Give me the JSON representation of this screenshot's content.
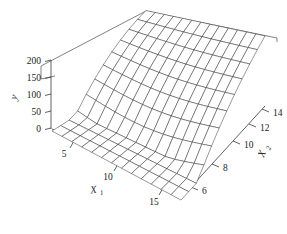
{
  "chart_data": {
    "type": "surface",
    "title": "",
    "xlabel": "X1",
    "ylabel": "X2",
    "zlabel": "y",
    "xlabel_base": "X",
    "xlabel_sub": "1",
    "ylabel_base": "X",
    "ylabel_sub": "2",
    "x_ticks": [
      5,
      10,
      15
    ],
    "x_tick_labels": [
      "5",
      "10",
      "15"
    ],
    "y_ticks": [
      6,
      8,
      10,
      12,
      14
    ],
    "y_tick_labels": [
      "6",
      "8",
      "10",
      "12",
      "14"
    ],
    "z_ticks": [
      0,
      50,
      100,
      150,
      200
    ],
    "z_tick_labels": [
      "0",
      "50",
      "100",
      "150",
      "200"
    ],
    "xlim": [
      2,
      17
    ],
    "ylim": [
      5,
      15
    ],
    "zlim": [
      0,
      200
    ],
    "grid": false,
    "legend": "none",
    "mesh_nx": 13,
    "mesh_ny": 11,
    "surface_color": "#ffffff",
    "mesh_color": "#1a1a1a",
    "frame_color": "#4a4a4a",
    "background": "#ffffff",
    "surface_equation_note": "z rises with X2 and with X1 interaction; back-left plateau near 170, back-middle dip, far-right corner maximum near 200",
    "z_values_corners": {
      "front_left": 0,
      "back_left": 170,
      "back_right": 200,
      "front_right": 30
    }
  },
  "axis_titles": {
    "x1": "X",
    "x1_sub": "1",
    "x2": "X",
    "x2_sub": "2",
    "z": "y"
  },
  "ticks": {
    "z": [
      "200",
      "150",
      "100",
      "50",
      "0"
    ],
    "x1": [
      "5",
      "10",
      "15"
    ],
    "x2": [
      "14",
      "12",
      "10",
      "8",
      "6"
    ]
  }
}
